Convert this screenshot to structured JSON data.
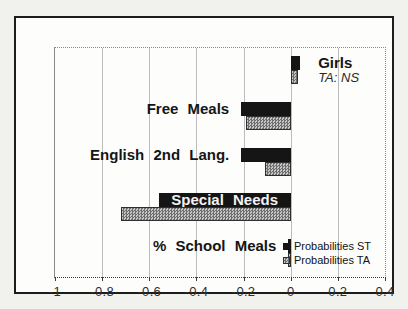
{
  "chart_data": {
    "type": "bar",
    "orientation": "horizontal",
    "categories": [
      "Girls",
      "Free Meals",
      "English 2nd Lang.",
      "Special Needs",
      "% School Meals"
    ],
    "series": [
      {
        "name": "Probabilities ST",
        "color": "#151515",
        "pattern": "solid",
        "values": [
          0.04,
          -0.21,
          -0.21,
          -0.56,
          -0.01
        ]
      },
      {
        "name": "Probabilities TA",
        "color": "#9a9a9a",
        "pattern": "crosshatch",
        "values": [
          0.03,
          -0.19,
          -0.11,
          -0.72,
          -0.01
        ]
      }
    ],
    "xlim": [
      -1,
      0.4
    ],
    "xticks": [
      -1,
      -0.8,
      -0.6,
      -0.4,
      -0.2,
      0,
      0.2,
      0.4
    ],
    "xtick_labels": [
      "-1",
      "-0.8",
      "-0.6",
      "-0.4",
      "-0.2",
      "0",
      "0.2",
      "0.4"
    ],
    "grid": "vertical",
    "title": "",
    "legend_position": "inside-bottom-right",
    "annotations": [
      {
        "text": "TA: NS",
        "category": "Girls",
        "style": "italic"
      }
    ]
  },
  "legend": {
    "items": [
      {
        "label": "Probabilities ST",
        "color": "#151515"
      },
      {
        "label": "Probabilities TA",
        "color": "#9a9a9a"
      }
    ]
  }
}
